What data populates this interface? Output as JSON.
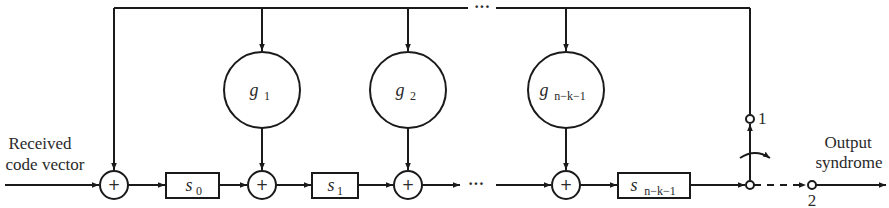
{
  "diagram": {
    "type": "syndrome-computation-circuit",
    "input_label_line1": "Received",
    "input_label_line2": "code vector",
    "output_label_line1": "Output",
    "output_label_line2": "syndrome",
    "registers": [
      {
        "name": "s",
        "subscript": "0"
      },
      {
        "name": "s",
        "subscript": "1"
      },
      {
        "name": "s",
        "subscript": "n−k−1"
      }
    ],
    "multipliers": [
      {
        "name": "g",
        "subscript": "1"
      },
      {
        "name": "g",
        "subscript": "2"
      },
      {
        "name": "g",
        "subscript": "n−k−1"
      }
    ],
    "adder_symbol": "+",
    "ellipsis": "···",
    "switch_positions": {
      "pos1": "1",
      "pos2": "2"
    }
  }
}
